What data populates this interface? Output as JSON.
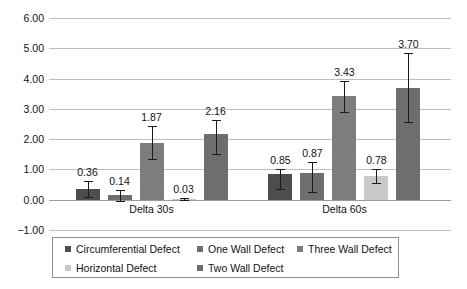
{
  "chart_data": {
    "type": "bar",
    "title": "",
    "subtitle": "",
    "xlabel": "",
    "ylabel": "",
    "categories": [
      "Delta 30s",
      "Delta 60s"
    ],
    "ylim": [
      -1.0,
      6.0
    ],
    "ytick_labels": [
      "6.00",
      "5.00",
      "4.00",
      "3.00",
      "2.00",
      "1.00",
      "0.00",
      "-1.00"
    ],
    "ytick_values": [
      6.0,
      5.0,
      4.0,
      3.0,
      2.0,
      1.0,
      0.0,
      -1.0
    ],
    "grid": true,
    "legend_position": "bottom",
    "series": [
      {
        "name": "Circumferential Defect",
        "color": "#4d4d4d",
        "values": [
          0.36,
          0.85
        ],
        "value_labels": [
          "0.36",
          "0.85"
        ],
        "err_low": [
          0.1,
          0.35
        ],
        "err_high": [
          0.62,
          1.0
        ]
      },
      {
        "name": "One Wall Defect",
        "color": "#6e6e6e",
        "values": [
          0.14,
          0.87
        ],
        "value_labels": [
          "0.14",
          "0.87"
        ],
        "err_low": [
          -0.05,
          0.27
        ],
        "err_high": [
          0.33,
          1.23
        ]
      },
      {
        "name": "Three Wall Defect",
        "color": "#7d7d7d",
        "values": [
          1.87,
          3.43
        ],
        "value_labels": [
          "1.87",
          "3.43"
        ],
        "err_low": [
          1.33,
          2.9
        ],
        "err_high": [
          2.42,
          3.93
        ]
      },
      {
        "name": "Horizontal Defect",
        "color": "#c9c9c9",
        "values": [
          0.03,
          0.78
        ],
        "value_labels": [
          "0.03",
          "0.78"
        ],
        "err_low": [
          -0.02,
          0.55
        ],
        "err_high": [
          0.07,
          1.0
        ]
      },
      {
        "name": "Two Wall Defect",
        "color": "#6e6e6e",
        "values": [
          2.16,
          3.7
        ],
        "value_labels": [
          "2.16",
          "3.70"
        ],
        "err_low": [
          1.52,
          2.56
        ],
        "err_high": [
          2.62,
          4.83
        ]
      }
    ]
  },
  "legend": {
    "items": [
      {
        "label": "Circumferential Defect",
        "color": "#4d4d4d"
      },
      {
        "label": "One Wall Defect",
        "color": "#6e6e6e"
      },
      {
        "label": "Three Wall Defect",
        "color": "#7d7d7d"
      },
      {
        "label": "Horizontal Defect",
        "color": "#c9c9c9"
      },
      {
        "label": "Two Wall Defect",
        "color": "#6e6e6e"
      }
    ]
  }
}
